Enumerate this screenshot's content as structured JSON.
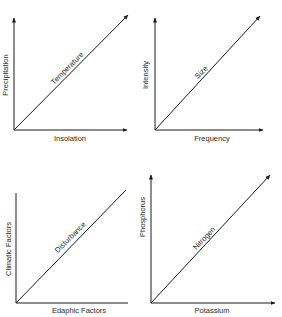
{
  "panels": [
    {
      "id": "top-left",
      "x_label": "Insolation",
      "y_label": "Precipitation",
      "diagonal_label": "Temperature"
    },
    {
      "id": "top-right",
      "x_label": "Frequency",
      "y_label": "Intensity",
      "diagonal_label": "Size"
    },
    {
      "id": "bottom-left",
      "x_label": "Edaphic Factors",
      "y_label": "Climatic Factors",
      "diagonal_label": "Disturbance"
    },
    {
      "id": "bottom-right",
      "x_label": "Potassium",
      "y_label": "Phosphorus",
      "diagonal_label": "Nitrogen"
    }
  ],
  "colors": {
    "line": "#1a1a1a",
    "text": "#2a2a2a",
    "background": "#ffffff"
  }
}
